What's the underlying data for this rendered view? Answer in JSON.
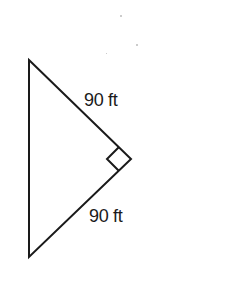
{
  "diagram": {
    "type": "right-triangle",
    "colors": {
      "stroke": "#1a1a1a",
      "background": "#ffffff"
    },
    "vertices": {
      "top": [
        29,
        60
      ],
      "right_angle": [
        131,
        159
      ],
      "bottom": [
        29,
        257
      ]
    },
    "right_angle_marker": true,
    "labels": {
      "upper_leg": "90 ft",
      "lower_leg": "90 ft"
    }
  }
}
